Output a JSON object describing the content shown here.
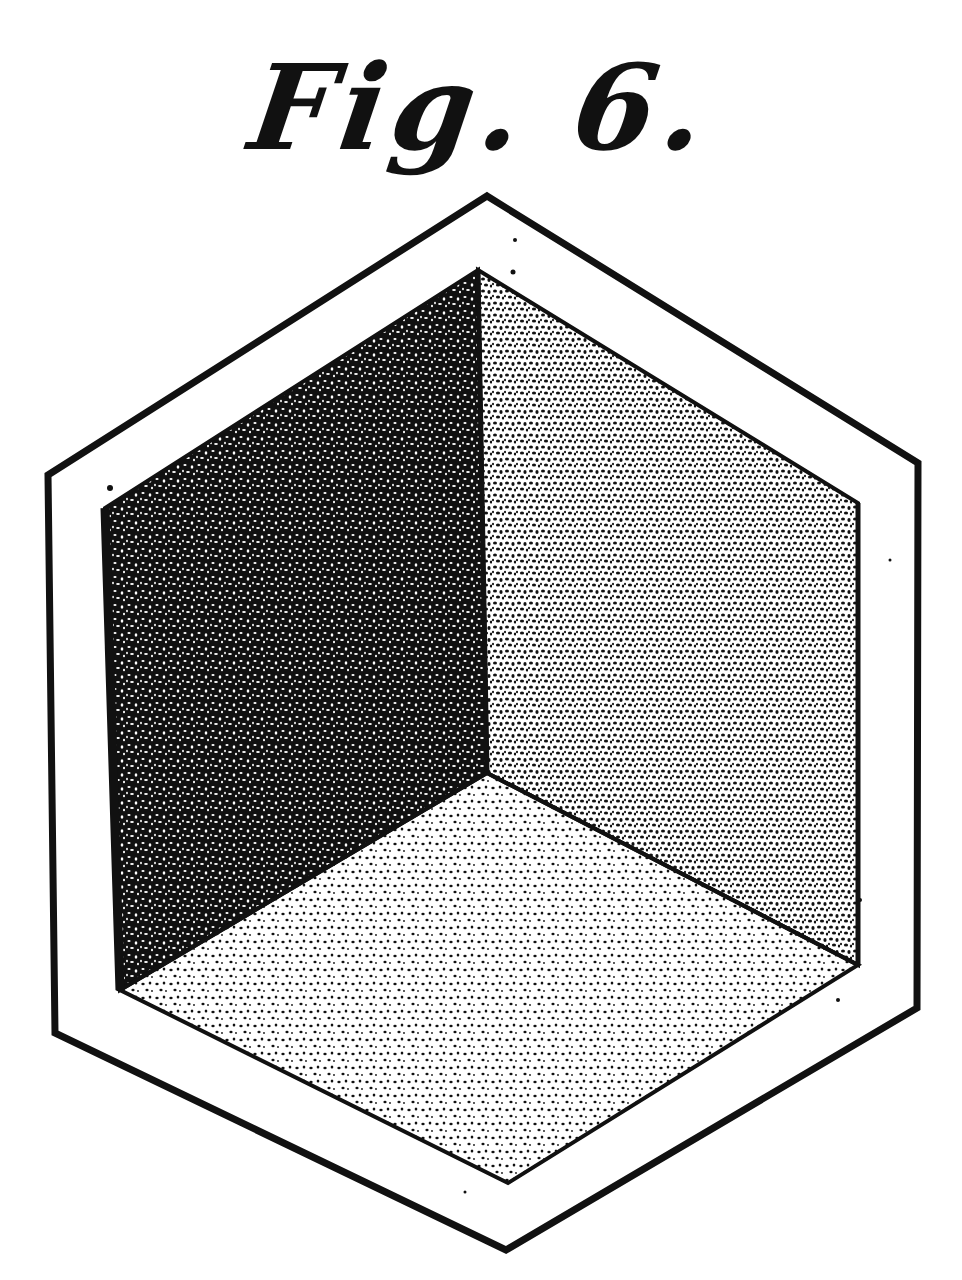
{
  "figure": {
    "caption": "Fig. 6.",
    "shading": {
      "left_wall": "dense stipple (darkest)",
      "right_wall": "medium stipple",
      "floor": "light stipple (lightest)"
    },
    "colors": {
      "ink": "#111111",
      "paper": "#ffffff"
    }
  }
}
